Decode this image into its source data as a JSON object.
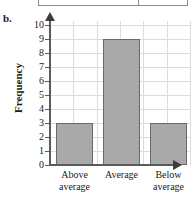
{
  "part_letter": "b.",
  "colors": {
    "bar_fill": "#a9a9a9",
    "bar_stroke": "#6a6a6a",
    "grid": "#dcdcdc",
    "axis": "#5a5a5a",
    "background": "#ffffff"
  },
  "chart_data": {
    "type": "bar",
    "title": "",
    "xlabel": "",
    "ylabel": "Frequency",
    "categories": [
      "Above average",
      "Average",
      "Below average"
    ],
    "category_lines": [
      [
        "Above",
        "average"
      ],
      [
        "Average",
        ""
      ],
      [
        "Below",
        "average"
      ]
    ],
    "values": [
      3,
      9,
      3
    ],
    "ylim": [
      0,
      10
    ],
    "ytick_labels": [
      "10",
      "9",
      "8",
      "7",
      "6",
      "5",
      "4",
      "3",
      "2",
      "1",
      "0"
    ],
    "ytick_values": [
      10,
      9,
      8,
      7,
      6,
      5,
      4,
      3,
      2,
      1,
      0
    ],
    "grid": true,
    "legend": false
  }
}
